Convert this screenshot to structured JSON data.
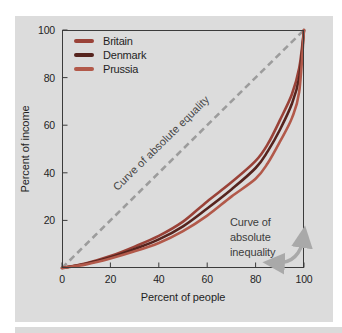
{
  "figure": {
    "panel_bg": "#dcdcdc",
    "axis_color": "#3b3b3b",
    "text_color": "#1f1f1f"
  },
  "chart_data": {
    "type": "line",
    "title": "",
    "xlabel": "Percent of people",
    "ylabel": "Percent of income",
    "xlim": [
      0,
      100
    ],
    "ylim": [
      0,
      100
    ],
    "x_ticks": [
      0,
      20,
      40,
      60,
      80,
      100
    ],
    "y_ticks": [
      20,
      40,
      60,
      80,
      100
    ],
    "grid": false,
    "legend_position": "top-left",
    "series": [
      {
        "name": "Britain",
        "color": "#9a4238",
        "points": [
          [
            0,
            0
          ],
          [
            10,
            2
          ],
          [
            20,
            5
          ],
          [
            30,
            9
          ],
          [
            40,
            13.5
          ],
          [
            50,
            19.5
          ],
          [
            60,
            28
          ],
          [
            70,
            36
          ],
          [
            80,
            45
          ],
          [
            85,
            52
          ],
          [
            90,
            62
          ],
          [
            95,
            73
          ],
          [
            98,
            84
          ],
          [
            100,
            100
          ]
        ]
      },
      {
        "name": "Denmark",
        "color": "#56241e",
        "points": [
          [
            0,
            0
          ],
          [
            10,
            1.8
          ],
          [
            20,
            4.5
          ],
          [
            30,
            8
          ],
          [
            40,
            12
          ],
          [
            50,
            17.5
          ],
          [
            60,
            25
          ],
          [
            70,
            33
          ],
          [
            80,
            42
          ],
          [
            85,
            49
          ],
          [
            90,
            58
          ],
          [
            95,
            69
          ],
          [
            98,
            80
          ],
          [
            100,
            100
          ]
        ]
      },
      {
        "name": "Prussia",
        "color": "#b2594a",
        "points": [
          [
            0,
            0
          ],
          [
            10,
            1.5
          ],
          [
            20,
            4
          ],
          [
            30,
            7
          ],
          [
            40,
            10.5
          ],
          [
            50,
            15.5
          ],
          [
            60,
            22
          ],
          [
            70,
            30
          ],
          [
            80,
            37.5
          ],
          [
            85,
            44
          ],
          [
            90,
            53
          ],
          [
            95,
            63
          ],
          [
            98,
            74
          ],
          [
            100,
            100
          ]
        ]
      }
    ],
    "equality_line": {
      "label": "Curve of absolute equality",
      "from": [
        0,
        0
      ],
      "to": [
        100,
        100
      ],
      "style": "dashed",
      "color": "#9c9c9c"
    },
    "annotations": [
      {
        "id": "inequality",
        "lines": [
          "Curve of",
          "absolute",
          "inequality"
        ],
        "arrow_color": "#a9a9a9"
      }
    ]
  }
}
